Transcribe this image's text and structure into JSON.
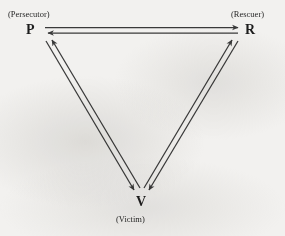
{
  "diagram": {
    "type": "triangle-role-diagram",
    "background_color": "#f2f1ef",
    "line_color": "#3a3a3a",
    "text_color": "#1d1d1d",
    "vertices": [
      {
        "id": "persecutor",
        "letter": "P",
        "role_label": "(Persecutor)",
        "position": "top-left",
        "x": 33,
        "y": 30
      },
      {
        "id": "rescuer",
        "letter": "R",
        "role_label": "(Rescuer)",
        "position": "top-right",
        "x": 250,
        "y": 30
      },
      {
        "id": "victim",
        "letter": "V",
        "role_label": "(Victim)",
        "position": "bottom-center",
        "x": 141,
        "y": 202
      }
    ],
    "edges": [
      {
        "id": "p-r",
        "from": "persecutor",
        "to": "rescuer",
        "style": "double-line-bidirectional",
        "arrows": [
          "toward-rescuer",
          "toward-persecutor"
        ]
      },
      {
        "id": "p-v",
        "from": "persecutor",
        "to": "victim",
        "style": "double-line-bidirectional",
        "arrows": [
          "toward-victim",
          "toward-persecutor"
        ]
      },
      {
        "id": "r-v",
        "from": "rescuer",
        "to": "victim",
        "style": "double-line-bidirectional",
        "arrows": [
          "toward-victim",
          "toward-rescuer"
        ]
      }
    ]
  }
}
